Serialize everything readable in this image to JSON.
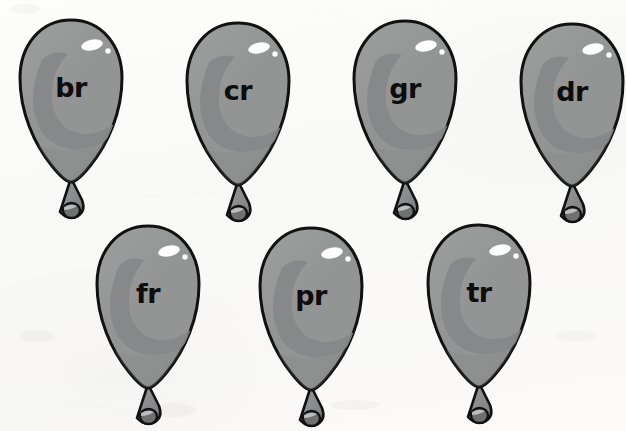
{
  "page": {
    "background_color": "#fbfaf8",
    "rows": 2
  },
  "palette": {
    "balloon_light": "#9c9d9d",
    "balloon_mid": "#939494",
    "balloon_dark": "#858687",
    "balloon_shadow": "#7e7f80",
    "outline": "#111111",
    "highlight": "#ffffff",
    "knot_fill": "#8e8f90",
    "knot_bead": "#6f7071",
    "text_color": "#0d0d0d"
  },
  "balloons": [
    {
      "id": "balloon-br",
      "label": "br",
      "row": 1,
      "column": 1,
      "x": 16,
      "y": 16
    },
    {
      "id": "balloon-cr",
      "label": "cr",
      "row": 1,
      "column": 2,
      "x": 183,
      "y": 19
    },
    {
      "id": "balloon-gr",
      "label": "gr",
      "row": 1,
      "column": 3,
      "x": 350,
      "y": 17
    },
    {
      "id": "balloon-dr",
      "label": "dr",
      "row": 1,
      "column": 4,
      "x": 517,
      "y": 20
    },
    {
      "id": "balloon-fr",
      "label": "fr",
      "row": 2,
      "column": 1,
      "x": 93,
      "y": 222
    },
    {
      "id": "balloon-pr",
      "label": "pr",
      "row": 2,
      "column": 2,
      "x": 256,
      "y": 224
    },
    {
      "id": "balloon-tr",
      "label": "tr",
      "row": 2,
      "column": 3,
      "x": 424,
      "y": 221
    }
  ],
  "creases": [
    {
      "x": 138,
      "y": 196,
      "w": 120,
      "h": 1,
      "rot": -3,
      "op": 0.16
    },
    {
      "x": 300,
      "y": 12,
      "w": 90,
      "h": 1,
      "rot": 5,
      "op": 0.1
    },
    {
      "x": 8,
      "y": 292,
      "w": 70,
      "h": 1,
      "rot": 24,
      "op": 0.12
    },
    {
      "x": 400,
      "y": 250,
      "w": 150,
      "h": 1,
      "rot": 18,
      "op": 0.13
    },
    {
      "x": 520,
      "y": 40,
      "w": 60,
      "h": 1,
      "rot": -40,
      "op": 0.09
    },
    {
      "x": 470,
      "y": 300,
      "w": 130,
      "h": 1,
      "rot": -14,
      "op": 0.1
    },
    {
      "x": 60,
      "y": 404,
      "w": 110,
      "h": 1,
      "rot": 4,
      "op": 0.09
    },
    {
      "x": 218,
      "y": 270,
      "w": 80,
      "h": 1,
      "rot": -22,
      "op": 0.08
    },
    {
      "x": 575,
      "y": 120,
      "w": 55,
      "h": 1,
      "rot": 62,
      "op": 0.08
    },
    {
      "x": 150,
      "y": 6,
      "w": 46,
      "h": 1,
      "rot": 8,
      "op": 0.07
    }
  ],
  "blotches": [
    {
      "x": 150,
      "y": 403,
      "w": 46,
      "h": 14
    },
    {
      "x": 556,
      "y": 330,
      "w": 40,
      "h": 12
    },
    {
      "x": 20,
      "y": 330,
      "w": 34,
      "h": 12
    },
    {
      "x": 330,
      "y": 400,
      "w": 50,
      "h": 10
    },
    {
      "x": 10,
      "y": 4,
      "w": 30,
      "h": 10
    }
  ]
}
